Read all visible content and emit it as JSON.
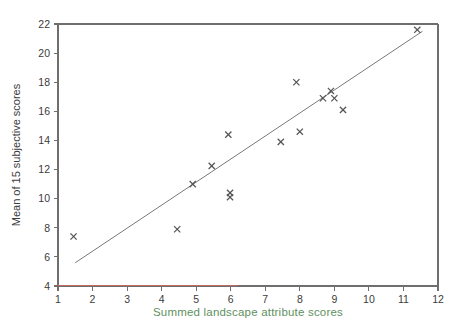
{
  "chart_data": {
    "type": "scatter",
    "title": "",
    "xlabel": "Summed landscape attribute scores",
    "ylabel": "Mean of 15 subjective scores",
    "xlim": [
      1,
      12
    ],
    "ylim": [
      4,
      22
    ],
    "xticks": [
      1,
      2,
      3,
      4,
      5,
      6,
      7,
      8,
      9,
      10,
      11,
      12
    ],
    "yticks": [
      4,
      6,
      8,
      10,
      12,
      14,
      16,
      18,
      20,
      22
    ],
    "xtick_labels": [
      "1",
      "2",
      "3",
      "4",
      "5",
      "6",
      "7",
      "8",
      "9",
      "10",
      "11",
      "12"
    ],
    "ytick_labels": [
      "4",
      "6",
      "8",
      "10",
      "12",
      "14",
      "16",
      "18",
      "20",
      "22"
    ],
    "grid": false,
    "legend": false,
    "marker": "x",
    "series": [
      {
        "name": "observations",
        "points": [
          {
            "x": 1.45,
            "y": 7.4
          },
          {
            "x": 4.45,
            "y": 7.9
          },
          {
            "x": 4.9,
            "y": 11.0
          },
          {
            "x": 5.45,
            "y": 12.25
          },
          {
            "x": 5.93,
            "y": 14.4
          },
          {
            "x": 5.98,
            "y": 10.4
          },
          {
            "x": 5.98,
            "y": 10.1
          },
          {
            "x": 7.45,
            "y": 13.9
          },
          {
            "x": 7.9,
            "y": 18.0
          },
          {
            "x": 8.0,
            "y": 14.6
          },
          {
            "x": 8.67,
            "y": 16.9
          },
          {
            "x": 8.9,
            "y": 17.4
          },
          {
            "x": 9.0,
            "y": 16.9
          },
          {
            "x": 9.25,
            "y": 16.1
          },
          {
            "x": 11.4,
            "y": 21.6
          }
        ]
      }
    ],
    "trendline": {
      "name": "least-squares fit",
      "x_start": 1.5,
      "y_start": 5.6,
      "x_end": 11.55,
      "y_end": 21.5
    },
    "axis_colors": {
      "frame": "#6e6e6e",
      "xlabel": "#5e9160",
      "baseline_highlight": "#c06a63",
      "marker": "#555555",
      "trendline": "#6a6a6a"
    }
  }
}
